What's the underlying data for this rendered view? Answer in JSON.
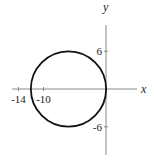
{
  "chart_data": {
    "type": "line",
    "title": "",
    "xlabel": "x",
    "ylabel": "y",
    "xlim": [
      -16.5,
      7.5
    ],
    "ylim": [
      -10,
      11
    ],
    "grid": false,
    "x_ticks": [
      {
        "value": -14,
        "label": "-14"
      },
      {
        "value": -10,
        "label": "-10"
      }
    ],
    "y_ticks": [
      {
        "value": 6,
        "label": "6"
      },
      {
        "value": -6,
        "label": "-6"
      }
    ],
    "series": [
      {
        "name": "circle",
        "shape": "circle",
        "equation": "(x+6)^2 + y^2 = 36",
        "center": [
          -6,
          0
        ],
        "radius": 6,
        "color": "#111111"
      }
    ],
    "axis_color": "#888888"
  }
}
